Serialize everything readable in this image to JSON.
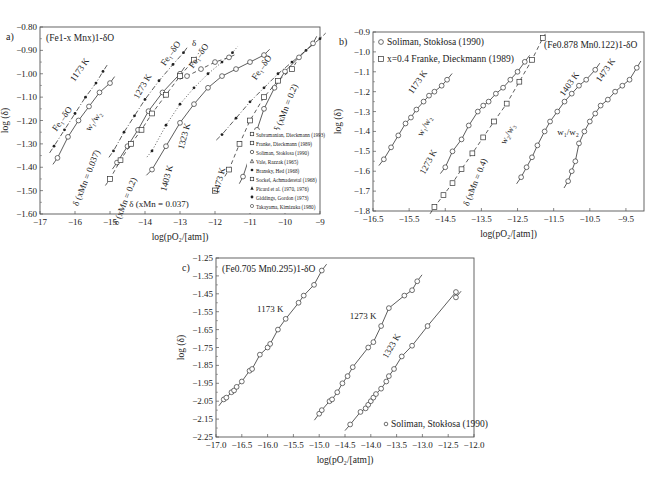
{
  "chart_data": [
    {
      "id": "a",
      "panel_label": "a)",
      "type": "scatter",
      "title": "(Fe1-x Mnx)1-δO",
      "xlabel": "log(pO2/[atm])",
      "ylabel": "log (δ)",
      "xlim": [
        -17,
        -9
      ],
      "ylim": [
        -1.6,
        -0.8
      ],
      "xticks": [
        -17,
        -16,
        -15,
        -14,
        -13,
        -12,
        -11,
        -10,
        -9
      ],
      "xtick_labels": [
        "-17",
        "-16",
        "-15",
        "-14",
        "-13",
        "-12",
        "-11",
        "-10",
        "-9"
      ],
      "yticks": [
        -0.8,
        -0.9,
        -1.0,
        -1.1,
        -1.2,
        -1.3,
        -1.4,
        -1.5,
        -1.6
      ],
      "ytick_labels": [
        "-0.80",
        "-0.90",
        "-1.00",
        "-1.10",
        "-1.20",
        "-1.30",
        "-1.40",
        "-1.50",
        "-1.60"
      ],
      "grid": false,
      "legend_position": "lower right",
      "legend": [
        {
          "marker": "square-dot",
          "label": "Subramanian, Dieckmann (1993)"
        },
        {
          "marker": "square",
          "label": "Franke, Dieckmann (1989)"
        },
        {
          "marker": "circle",
          "label": "Soliman, Stokłosa (1990)"
        },
        {
          "marker": "tri-open",
          "label": "Vale, Razzak (1965)"
        },
        {
          "marker": "filled-circle",
          "label": "Bransky, Hed (1968)"
        },
        {
          "marker": "square-x",
          "label": "Sockel, Achmaderetal (1968)"
        },
        {
          "marker": "filled-tri",
          "label": "Picard et al. (1970, 1976)"
        },
        {
          "marker": "filled-small",
          "label": "Giddings, Gordon (1973)"
        },
        {
          "marker": "circle-small",
          "label": "Takayama, Kimizuka (1980)"
        }
      ],
      "series": [
        {
          "name": "1173 K Fe1-δO",
          "style": "dashdot",
          "marker": "filled-small",
          "x": [
            -16.6,
            -16.3,
            -16.0,
            -15.7,
            -15.4,
            -15.2
          ],
          "y": [
            -1.31,
            -1.24,
            -1.17,
            -1.1,
            -1.04,
            -0.99
          ]
        },
        {
          "name": "1173 K δ(xMn=0.037)",
          "style": "solid",
          "marker": "circle",
          "x": [
            -16.5,
            -16.2,
            -15.9,
            -15.6,
            -15.3,
            -15.0
          ],
          "y": [
            -1.36,
            -1.27,
            -1.2,
            -1.14,
            -1.08,
            -1.04
          ]
        },
        {
          "name": "1273 K Fe1-δO",
          "style": "dashdot",
          "marker": "filled-small",
          "x": [
            -14.9,
            -14.6,
            -14.3,
            -14.0,
            -13.6,
            -13.2,
            -12.9
          ],
          "y": [
            -1.33,
            -1.25,
            -1.18,
            -1.11,
            -1.03,
            -0.96,
            -0.91
          ]
        },
        {
          "name": "1273 K δ(xMn=0.037)",
          "style": "solid",
          "marker": "circle",
          "x": [
            -14.8,
            -14.5,
            -14.2,
            -13.9,
            -13.5,
            -13.0
          ],
          "y": [
            -1.38,
            -1.31,
            -1.24,
            -1.16,
            -1.08,
            -1.0
          ]
        },
        {
          "name": "1273 K δ(xMn=0.2)",
          "style": "dashed",
          "marker": "square",
          "x": [
            -15.0,
            -14.7,
            -14.4,
            -14.1,
            -13.8,
            -13.4,
            -13.0,
            -12.6
          ],
          "y": [
            -1.45,
            -1.37,
            -1.3,
            -1.24,
            -1.17,
            -1.09,
            -1.01,
            -0.94
          ]
        },
        {
          "name": "1323 K Fe1-δO",
          "style": "dotted",
          "marker": "filled-small",
          "x": [
            -13.8,
            -13.4,
            -13.0,
            -12.6,
            -12.2,
            -11.8,
            -11.5
          ],
          "y": [
            -1.33,
            -1.22,
            -1.13,
            -1.06,
            -1.0,
            -0.95,
            -0.91
          ]
        },
        {
          "name": "1403 K δ(xMn=0.037)",
          "style": "solid",
          "marker": "circle",
          "x": [
            -13.8,
            -13.4,
            -13.0,
            -12.6,
            -12.2,
            -11.8,
            -11.4,
            -11.0,
            -10.6
          ],
          "y": [
            -1.41,
            -1.31,
            -1.21,
            -1.13,
            -1.06,
            -1.01,
            -0.98,
            -0.95,
            -0.92
          ]
        },
        {
          "name": "1403 K δ(xMn=0.2)",
          "style": "dashed",
          "marker": "circle",
          "x": [
            -12.8,
            -12.4,
            -12.0,
            -11.6
          ],
          "y": [
            -1.01,
            -0.98,
            -0.95,
            -0.93
          ]
        },
        {
          "name": "1473 K Fe1-δO",
          "style": "dashdot",
          "marker": "filled-small",
          "x": [
            -11.8,
            -11.4,
            -11.0,
            -10.6,
            -10.2,
            -9.8,
            -9.4,
            -9.0
          ],
          "y": [
            -1.26,
            -1.19,
            -1.12,
            -1.06,
            -1.0,
            -0.95,
            -0.9,
            -0.85
          ]
        },
        {
          "name": "1473 K δ(xMn=0.037)",
          "style": "solid",
          "marker": "circle",
          "x": [
            -11.2,
            -11.0,
            -10.8,
            -10.6,
            -10.3,
            -10.0,
            -9.6,
            -9.2
          ],
          "y": [
            -1.44,
            -1.35,
            -1.24,
            -1.15,
            -1.06,
            -0.99,
            -0.93,
            -0.87
          ]
        },
        {
          "name": "1473 K δ(xMn=0.2)",
          "style": "dashed",
          "marker": "square",
          "x": [
            -11.6,
            -11.3,
            -11.0,
            -10.6,
            -10.2,
            -9.8
          ],
          "y": [
            -1.41,
            -1.3,
            -1.2,
            -1.1,
            -1.03,
            -0.98
          ]
        }
      ],
      "extra_points": [
        {
          "x": -12.0,
          "y": -1.5,
          "marker": "square"
        }
      ],
      "annotations": [
        {
          "text": "1173 K",
          "x": -15.8,
          "y": -0.99,
          "rotate": -55
        },
        {
          "text": "Fe1-δO",
          "x": -16.3,
          "y": -1.2,
          "rotate": -55
        },
        {
          "text": "W1/W2",
          "x": -15.4,
          "y": -1.21,
          "rotate": -55
        },
        {
          "text": "δ (xMn = 0.037)",
          "x": -15.6,
          "y": -1.45,
          "rotate": -68
        },
        {
          "text": "1273 K",
          "x": -14.0,
          "y": -1.06,
          "rotate": -60
        },
        {
          "text": "δ (xMn = 0.2)",
          "x": -14.5,
          "y": -1.55,
          "rotate": -68
        },
        {
          "text": "Fe1-δO",
          "x": -13.2,
          "y": -0.92,
          "rotate": -55
        },
        {
          "text": "δ",
          "x": -12.6,
          "y": -0.88,
          "rotate": 0
        },
        {
          "text": "Fe1-δO",
          "x": -12.4,
          "y": -0.93,
          "rotate": -55
        },
        {
          "text": "1323 K",
          "x": -12.8,
          "y": -1.27,
          "rotate": -75
        },
        {
          "text": "1403 K",
          "x": -13.3,
          "y": -1.45,
          "rotate": -75
        },
        {
          "text": "1473 K",
          "x": -11.8,
          "y": -1.46,
          "rotate": -75
        },
        {
          "text": "δ (xMn = 0.037)",
          "x": -13.6,
          "y": -1.57,
          "rotate": 0
        },
        {
          "text": "Fe1-δO",
          "x": -10.6,
          "y": -0.98,
          "rotate": -55
        },
        {
          "text": "δ (xMn = 0.2)",
          "x": -9.9,
          "y": -1.15,
          "rotate": -68
        }
      ]
    },
    {
      "id": "b",
      "panel_label": "b)",
      "type": "scatter",
      "title": "(Fe0.878 Mn0.122)1-δO",
      "xlabel": "log(pO2/[atm])",
      "ylabel": "log (δ)",
      "xlim": [
        -16.5,
        -9.0
      ],
      "ylim": [
        -1.8,
        -0.9
      ],
      "xticks": [
        -16.5,
        -15.5,
        -14.5,
        -13.5,
        -12.5,
        -11.5,
        -10.5,
        -9.5
      ],
      "xtick_labels": [
        "-16.5",
        "-15.5",
        "-14.5",
        "-13.5",
        "-12.5",
        "-11.5",
        "-10.5",
        "-9.5"
      ],
      "yticks": [
        -0.9,
        -1.0,
        -1.1,
        -1.2,
        -1.3,
        -1.4,
        -1.5,
        -1.6,
        -1.7,
        -1.8
      ],
      "ytick_labels": [
        "-0.9",
        "-1.0",
        "-1.1",
        "-1.2",
        "-1.3",
        "-1.4",
        "-1.5",
        "-1.6",
        "-1.7",
        "-1.8"
      ],
      "grid": false,
      "legend_position": "upper left",
      "legend": [
        {
          "marker": "circle",
          "label": "Soliman, Stokłosa (1990)"
        },
        {
          "marker": "square",
          "label": "x=0.4 Franke, Dieckmann (1989)"
        }
      ],
      "series": [
        {
          "name": "1173 K",
          "style": "solid",
          "marker": "circle",
          "x": [
            -16.2,
            -16.0,
            -15.8,
            -15.6,
            -15.45,
            -15.3,
            -15.1,
            -14.95,
            -14.8,
            -14.6,
            -14.45
          ],
          "y": [
            -1.54,
            -1.48,
            -1.42,
            -1.36,
            -1.33,
            -1.29,
            -1.25,
            -1.22,
            -1.2,
            -1.17,
            -1.14
          ]
        },
        {
          "name": "1273 K",
          "style": "solid",
          "marker": "circle",
          "x": [
            -14.5,
            -14.3,
            -14.05,
            -13.85,
            -13.6,
            -13.45,
            -13.3,
            -13.1,
            -12.9,
            -12.7,
            -12.5,
            -12.3
          ],
          "y": [
            -1.58,
            -1.5,
            -1.44,
            -1.37,
            -1.3,
            -1.27,
            -1.25,
            -1.21,
            -1.18,
            -1.14,
            -1.1,
            -1.05
          ]
        },
        {
          "name": "x=0.4 1273 K",
          "style": "dashed",
          "marker": "square",
          "x": [
            -14.8,
            -14.55,
            -14.3,
            -14.05,
            -13.75,
            -13.45,
            -13.15,
            -12.8,
            -12.45,
            -12.1,
            -11.8
          ],
          "y": [
            -1.78,
            -1.72,
            -1.66,
            -1.59,
            -1.51,
            -1.43,
            -1.35,
            -1.26,
            -1.15,
            -1.04,
            -0.93
          ]
        },
        {
          "name": "1403 K",
          "style": "solid",
          "marker": "circle",
          "x": [
            -12.4,
            -12.25,
            -12.1,
            -11.95,
            -11.75,
            -11.6,
            -11.4,
            -11.2,
            -11.0,
            -10.8,
            -10.6,
            -10.35
          ],
          "y": [
            -1.63,
            -1.58,
            -1.53,
            -1.47,
            -1.4,
            -1.35,
            -1.3,
            -1.25,
            -1.21,
            -1.17,
            -1.14,
            -1.09
          ]
        },
        {
          "name": "1473 K",
          "style": "solid",
          "marker": "circle",
          "x": [
            -11.1,
            -11.0,
            -10.9,
            -10.8,
            -10.65,
            -10.5,
            -10.35,
            -10.2,
            -10.0,
            -9.8,
            -9.6,
            -9.4,
            -9.2
          ],
          "y": [
            -1.65,
            -1.6,
            -1.55,
            -1.46,
            -1.4,
            -1.35,
            -1.31,
            -1.27,
            -1.24,
            -1.2,
            -1.17,
            -1.14,
            -1.08
          ]
        }
      ],
      "annotations": [
        {
          "text": "1173 K",
          "x": -15.2,
          "y": -1.16,
          "rotate": -55
        },
        {
          "text": "W1/W2",
          "x": -15.0,
          "y": -1.38,
          "rotate": -62
        },
        {
          "text": "1273 K",
          "x": -14.9,
          "y": -1.56,
          "rotate": -62
        },
        {
          "text": "δ (xMn = 0.4)",
          "x": -13.6,
          "y": -1.66,
          "rotate": -68
        },
        {
          "text": "W2/W3",
          "x": -12.7,
          "y": -1.42,
          "rotate": -62
        },
        {
          "text": "1403 K",
          "x": -11.0,
          "y": -1.17,
          "rotate": -55
        },
        {
          "text": "W1/W2",
          "x": -11.1,
          "y": -1.42,
          "rotate": 0
        },
        {
          "text": "1473 K",
          "x": -10.0,
          "y": -1.1,
          "rotate": -55
        }
      ]
    },
    {
      "id": "c",
      "panel_label": "c)",
      "type": "scatter",
      "title": "(Fe0.705 Mn0.295)1-δO",
      "xlabel": "log(pO2/[atm])",
      "ylabel": "log (δ)",
      "xlim": [
        -17.0,
        -12.0
      ],
      "ylim": [
        -2.25,
        -1.25
      ],
      "xticks": [
        -17.0,
        -16.5,
        -16.0,
        -15.5,
        -15.0,
        -14.5,
        -14.0,
        -13.5,
        -13.0,
        -12.5,
        -12.0
      ],
      "xtick_labels": [
        "-17.0",
        "-16.5",
        "-16.0",
        "-15.5",
        "-15.0",
        "-14.5",
        "-14.0",
        "-13.5",
        "-13.0",
        "-12.5",
        "-12.0"
      ],
      "yticks": [
        -1.25,
        -1.35,
        -1.45,
        -1.55,
        -1.65,
        -1.75,
        -1.85,
        -1.95,
        -2.05,
        -2.15,
        -2.25
      ],
      "ytick_labels": [
        "-1.25",
        "-1.35",
        "-1.45",
        "-1.55",
        "-1.65",
        "-1.75",
        "-1.85",
        "-1.95",
        "-2.05",
        "-2.15",
        "-2.25"
      ],
      "grid": false,
      "legend_position": "lower right",
      "legend": [
        {
          "marker": "circle",
          "label": "Soliman, Stokłosa (1990)"
        }
      ],
      "series": [
        {
          "name": "1173 K",
          "style": "solid",
          "marker": "circle",
          "x": [
            -16.85,
            -16.8,
            -16.7,
            -16.65,
            -16.6,
            -16.5,
            -16.35,
            -16.3,
            -16.15,
            -16.0,
            -15.95,
            -15.8,
            -15.65,
            -15.4,
            -15.3,
            -15.1,
            -14.95
          ],
          "y": [
            -2.04,
            -2.03,
            -2.0,
            -1.99,
            -1.97,
            -1.94,
            -1.88,
            -1.87,
            -1.79,
            -1.75,
            -1.73,
            -1.65,
            -1.59,
            -1.5,
            -1.46,
            -1.4,
            -1.32
          ]
        },
        {
          "name": "1273 K",
          "style": "solid",
          "marker": "circle",
          "x": [
            -15.0,
            -14.95,
            -14.8,
            -14.75,
            -14.65,
            -14.55,
            -14.45,
            -14.35,
            -14.05,
            -13.95,
            -13.8,
            -13.65,
            -13.35,
            -13.2,
            -13.1
          ],
          "y": [
            -2.12,
            -2.1,
            -2.05,
            -2.04,
            -2.0,
            -1.95,
            -1.91,
            -1.86,
            -1.75,
            -1.72,
            -1.63,
            -1.53,
            -1.46,
            -1.43,
            -1.38
          ]
        },
        {
          "name": "1323 K",
          "style": "solid",
          "marker": "circle",
          "x": [
            -14.4,
            -14.2,
            -14.1,
            -14.05,
            -14.0,
            -13.95,
            -13.9,
            -13.8,
            -13.7,
            -13.65,
            -13.55,
            -13.4,
            -13.2,
            -12.9,
            -12.35,
            -12.35
          ],
          "y": [
            -2.18,
            -2.11,
            -2.09,
            -2.07,
            -2.05,
            -2.03,
            -2.01,
            -1.98,
            -1.94,
            -1.91,
            -1.87,
            -1.8,
            -1.74,
            -1.63,
            -1.44,
            -1.47
          ]
        }
      ],
      "annotations": [
        {
          "text": "1173 K",
          "x": -15.95,
          "y": -1.55,
          "rotate": 0
        },
        {
          "text": "1273 K",
          "x": -14.15,
          "y": -1.59,
          "rotate": 0
        },
        {
          "text": "1323 K",
          "x": -13.55,
          "y": -1.75,
          "rotate": -60
        }
      ]
    }
  ],
  "panels_layout": {
    "a": {
      "left": 40,
      "top": 27,
      "right": 320,
      "bottom": 214
    },
    "b": {
      "left": 373,
      "top": 32,
      "right": 644,
      "bottom": 211
    },
    "c": {
      "left": 216,
      "top": 258,
      "right": 474,
      "bottom": 437
    }
  }
}
